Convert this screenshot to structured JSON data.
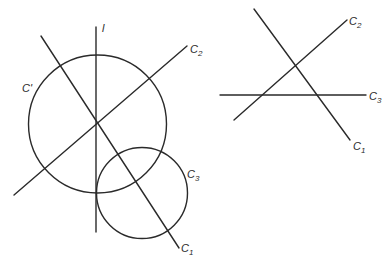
{
  "left_figure": {
    "description": "Three concurrent lines C1, C2 and line l meeting at a point, with circle C' centered at the intersection and circle C3 tangent-like region",
    "lines": [
      {
        "id": "l",
        "label": "l",
        "x1": 96,
        "y1": 27,
        "x2": 96,
        "y2": 232
      },
      {
        "id": "C1",
        "label_main": "C",
        "label_sub": "1",
        "x1": 41,
        "y1": 36,
        "x2": 179,
        "y2": 248
      },
      {
        "id": "C2",
        "label_main": "C",
        "label_sub": "2",
        "x1": 14,
        "y1": 195,
        "x2": 187,
        "y2": 46
      }
    ],
    "circles": [
      {
        "id": "C_prime",
        "label": "C'",
        "cx": 97.5,
        "cy": 124,
        "r": 69
      },
      {
        "id": "C3",
        "label_main": "C",
        "label_sub": "3",
        "cx": 142,
        "cy": 193,
        "r": 45.5
      }
    ],
    "labels": {
      "l": {
        "text": "l",
        "x": 102,
        "y": 32
      },
      "C_prime": {
        "text": "C'",
        "x": 22,
        "y": 92
      },
      "C2": {
        "main": "C",
        "sub": "2",
        "x": 190,
        "y": 53
      },
      "C3": {
        "main": "C",
        "sub": "3",
        "x": 187,
        "y": 178
      },
      "C1": {
        "main": "C",
        "sub": "1",
        "x": 181,
        "y": 252
      }
    }
  },
  "right_figure": {
    "description": "Three lines C1, C2, C3 forming a triangle",
    "lines": [
      {
        "id": "C1",
        "x1": 254,
        "y1": 9,
        "x2": 350,
        "y2": 140
      },
      {
        "id": "C2",
        "x1": 234,
        "y1": 120,
        "x2": 347,
        "y2": 20
      },
      {
        "id": "C3",
        "x1": 220,
        "y1": 95,
        "x2": 366,
        "y2": 95
      }
    ],
    "labels": {
      "C2": {
        "main": "C",
        "sub": "2",
        "x": 349,
        "y": 25
      },
      "C3": {
        "main": "C",
        "sub": "3",
        "x": 369,
        "y": 100
      },
      "C1": {
        "main": "C",
        "sub": "1",
        "x": 353,
        "y": 150
      }
    }
  }
}
